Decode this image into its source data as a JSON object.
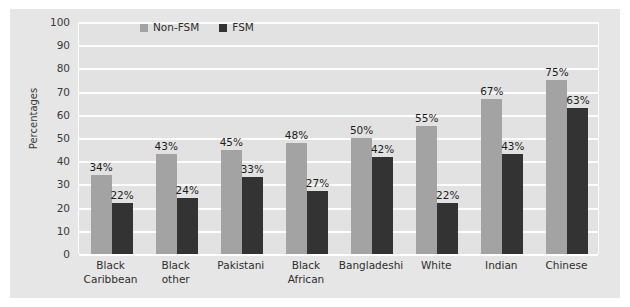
{
  "chart_data": {
    "type": "bar",
    "title": "",
    "subtitle": "",
    "xlabel": "",
    "ylabel": "Percentages",
    "ylim": [
      0,
      100
    ],
    "ytick_step": 10,
    "yticks": [
      100,
      90,
      80,
      70,
      60,
      50,
      40,
      30,
      20,
      10,
      0
    ],
    "grid": true,
    "legend_position": "top-center",
    "value_label_suffix": "%",
    "categories": [
      "Black Caribbean",
      "Black other",
      "Pakistani",
      "Black African",
      "Bangladeshi",
      "White",
      "Indian",
      "Chinese"
    ],
    "category_lines": [
      [
        "Black",
        "Caribbean"
      ],
      [
        "Black",
        "other"
      ],
      [
        "Pakistani",
        ""
      ],
      [
        "Black",
        "African"
      ],
      [
        "Bangladeshi",
        ""
      ],
      [
        "White",
        ""
      ],
      [
        "Indian",
        ""
      ],
      [
        "Chinese",
        ""
      ]
    ],
    "series": [
      {
        "name": "Non-FSM",
        "color": "#a3a3a3",
        "values": [
          34,
          43,
          45,
          48,
          50,
          55,
          67,
          75
        ],
        "labels": [
          "34%",
          "43%",
          "45%",
          "48%",
          "50%",
          "55%",
          "67%",
          "75%"
        ]
      },
      {
        "name": "FSM",
        "color": "#333333",
        "values": [
          22,
          24,
          33,
          27,
          42,
          22,
          43,
          63
        ],
        "labels": [
          "22%",
          "24%",
          "33%",
          "27%",
          "42%",
          "22%",
          "43%",
          "63%"
        ]
      }
    ]
  },
  "legend": {
    "items": [
      {
        "label": "Non-FSM",
        "color": "#a3a3a3"
      },
      {
        "label": "FSM",
        "color": "#333333"
      }
    ]
  },
  "colors": {
    "page_background": "#ffffff",
    "canvas_background": "#e6e6e6",
    "plot_background": "#e2e2e2",
    "gridline": "#ffffff",
    "series_non_fsm": "#a3a3a3",
    "series_fsm": "#333333",
    "text": "#2e2e2e"
  }
}
